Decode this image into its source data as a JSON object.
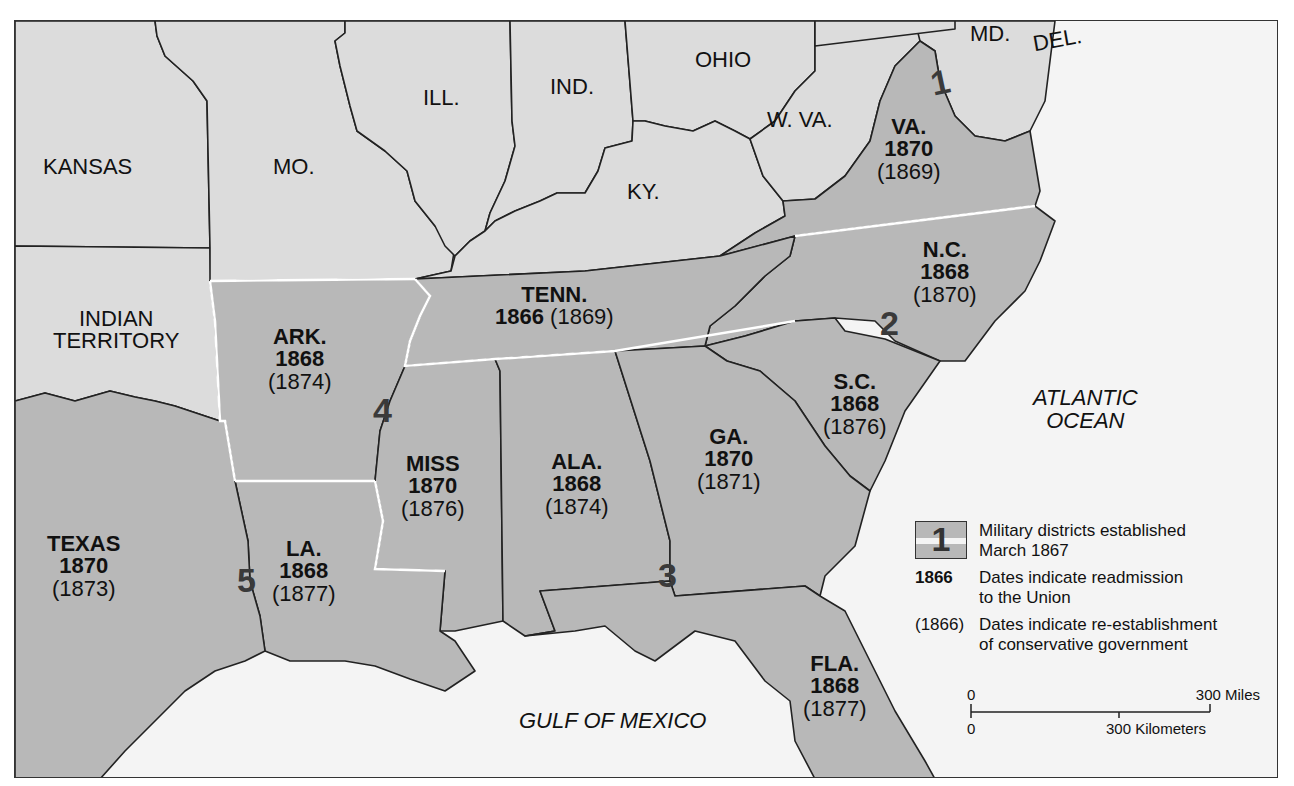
{
  "map": {
    "colors": {
      "ocean": "#f4f4f4",
      "union_state": "#dcdcdc",
      "former_confederate_state": "#b8b8b8",
      "border": "#222222",
      "district_border": "#ffffff",
      "district_number": "#3a3a3a"
    },
    "other_states": [
      {
        "id": "kansas",
        "label": "KANSAS"
      },
      {
        "id": "missouri",
        "label": "MO."
      },
      {
        "id": "illinois",
        "label": "ILL."
      },
      {
        "id": "indiana",
        "label": "IND."
      },
      {
        "id": "ohio",
        "label": "OHIO"
      },
      {
        "id": "kentucky",
        "label": "KY."
      },
      {
        "id": "west-virginia",
        "label": "W. VA."
      },
      {
        "id": "maryland",
        "label": "MD."
      },
      {
        "id": "delaware",
        "label": "DEL."
      },
      {
        "id": "indian-territory",
        "label_line1": "INDIAN",
        "label_line2": "TERRITORY"
      }
    ],
    "reconstruction_states": [
      {
        "id": "virginia",
        "name": "VA.",
        "readmitted": "1870",
        "conservative": "(1869)"
      },
      {
        "id": "north-carolina",
        "name": "N.C.",
        "readmitted": "1868",
        "conservative": "(1870)"
      },
      {
        "id": "south-carolina",
        "name": "S.C.",
        "readmitted": "1868",
        "conservative": "(1876)"
      },
      {
        "id": "tennessee",
        "name": "TENN.",
        "readmitted": "1866",
        "conservative": "(1869)"
      },
      {
        "id": "arkansas",
        "name": "ARK.",
        "readmitted": "1868",
        "conservative": "(1874)"
      },
      {
        "id": "mississippi",
        "name": "MISS",
        "readmitted": "1870",
        "conservative": "(1876)"
      },
      {
        "id": "alabama",
        "name": "ALA.",
        "readmitted": "1868",
        "conservative": "(1874)"
      },
      {
        "id": "georgia",
        "name": "GA.",
        "readmitted": "1870",
        "conservative": "(1871)"
      },
      {
        "id": "louisiana",
        "name": "LA.",
        "readmitted": "1868",
        "conservative": "(1877)"
      },
      {
        "id": "texas",
        "name": "TEXAS",
        "readmitted": "1870",
        "conservative": "(1873)"
      },
      {
        "id": "florida",
        "name": "FLA.",
        "readmitted": "1868",
        "conservative": "(1877)"
      }
    ],
    "military_districts": [
      "1",
      "2",
      "3",
      "4",
      "5"
    ],
    "water_bodies": {
      "atlantic_line1": "ATLANTIC",
      "atlantic_line2": "OCEAN",
      "gulf": "GULF OF MEXICO"
    },
    "legend": {
      "district_key": "1",
      "district_text_line1": "Military districts established",
      "district_text_line2": "March 1867",
      "readmission_key": "1866",
      "readmission_text_line1": "Dates indicate readmission",
      "readmission_text_line2": "to the Union",
      "conservative_key": "(1866)",
      "conservative_text_line1": "Dates indicate re-establishment",
      "conservative_text_line2": "of conservative government"
    },
    "scale": {
      "miles_zero": "0",
      "miles_label": "300 Miles",
      "km_zero": "0",
      "km_label": "300 Kilometers"
    }
  }
}
